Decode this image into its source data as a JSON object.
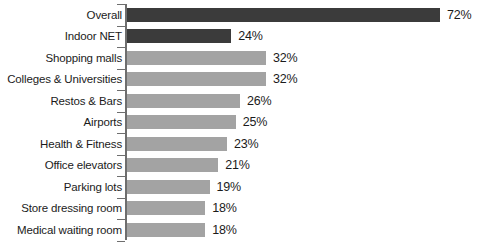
{
  "chart_data": {
    "type": "bar",
    "orientation": "horizontal",
    "title": "",
    "subtitle": "",
    "xlabel": "",
    "ylabel": "",
    "grid": false,
    "legend": "none",
    "value_suffix": "%",
    "xlim": [
      0,
      72
    ],
    "axis_visible": true,
    "categories": [
      "Overall",
      "Indoor NET",
      "Shopping malls",
      "Colleges & Universities",
      "Restos & Bars",
      "Airports",
      "Health & Fitness",
      "Office elevators",
      "Parking lots",
      "Store dressing room",
      "Medical waiting room"
    ],
    "values": [
      72,
      24,
      32,
      32,
      26,
      25,
      23,
      21,
      19,
      18,
      18
    ],
    "value_labels": [
      "72%",
      "24%",
      "32%",
      "32%",
      "26%",
      "25%",
      "23%",
      "21%",
      "19%",
      "18%",
      "18%"
    ],
    "bar_styles": [
      "dark",
      "dark",
      "light",
      "light",
      "light",
      "light",
      "light",
      "light",
      "light",
      "light",
      "light"
    ],
    "colors": {
      "dark_bar": "#3b3b3b",
      "light_bar": "#a3a3a3",
      "axis": "#6e6e6e",
      "text": "#1b1b1b",
      "background": "#ffffff"
    }
  }
}
